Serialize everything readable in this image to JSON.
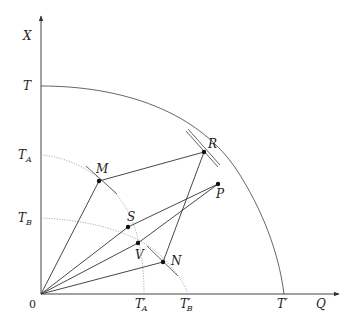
{
  "diagram": {
    "axes": {
      "y_label": "X",
      "x_label": "Q",
      "origin_label": "0"
    },
    "y_ticks": [
      {
        "id": "T",
        "label": "T",
        "sub": ""
      },
      {
        "id": "TA",
        "label": "T",
        "sub": "A"
      },
      {
        "id": "TB",
        "label": "T",
        "sub": "B"
      }
    ],
    "x_ticks": [
      {
        "id": "TA_prime",
        "label": "T′",
        "sub": "A"
      },
      {
        "id": "TB_prime",
        "label": "T′",
        "sub": "B"
      },
      {
        "id": "T_prime",
        "label": "T′",
        "sub": ""
      }
    ],
    "points": {
      "M": "M",
      "R": "R",
      "P": "P",
      "S": "S",
      "V": "V",
      "N": "N"
    },
    "curves": [
      {
        "name": "outer-frontier",
        "style": "solid",
        "from": "T",
        "to": "T′"
      },
      {
        "name": "frontier-A",
        "style": "dotted",
        "from": "T_A",
        "to": "T′_A"
      },
      {
        "name": "frontier-B",
        "style": "dotted",
        "from": "T_B",
        "to": "T′_B"
      }
    ],
    "segments": [
      "0–M",
      "0–S",
      "0–V",
      "0–N",
      "M–R",
      "R–N",
      "S–P",
      "V–P"
    ]
  }
}
